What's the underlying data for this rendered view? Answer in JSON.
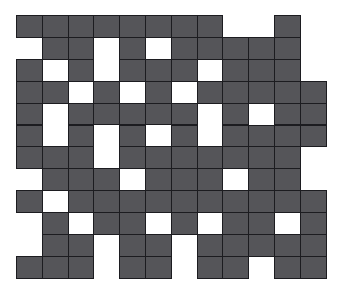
{
  "figure": {
    "name": "binary-grid-pattern",
    "type": "grid",
    "background_color": "#ffffff",
    "fill_color": "#555559",
    "stroke_color": "#1c1c20",
    "empty_color": "#ffffff"
  },
  "grid": {
    "rows": 12,
    "columns": 12,
    "origin_x": 16,
    "origin_y": 15,
    "cell_width": 25.8,
    "cell_height": 21.9,
    "legend": {
      "1": "filled cell",
      "0": "empty cell"
    },
    "matrix": [
      [
        1,
        1,
        1,
        1,
        1,
        1,
        1,
        1,
        0,
        0,
        1,
        0
      ],
      [
        0,
        1,
        1,
        0,
        1,
        0,
        1,
        1,
        1,
        1,
        1,
        0
      ],
      [
        1,
        0,
        1,
        0,
        1,
        1,
        1,
        0,
        1,
        1,
        1,
        0
      ],
      [
        1,
        1,
        0,
        1,
        0,
        1,
        0,
        1,
        1,
        1,
        1,
        1
      ],
      [
        1,
        0,
        1,
        1,
        1,
        1,
        1,
        0,
        1,
        0,
        1,
        1
      ],
      [
        1,
        0,
        1,
        0,
        1,
        0,
        1,
        0,
        1,
        1,
        1,
        1
      ],
      [
        1,
        1,
        1,
        0,
        1,
        1,
        1,
        1,
        1,
        1,
        1,
        0
      ],
      [
        0,
        1,
        1,
        1,
        0,
        1,
        1,
        1,
        0,
        1,
        1,
        0
      ],
      [
        1,
        0,
        1,
        1,
        1,
        1,
        1,
        1,
        1,
        1,
        1,
        1
      ],
      [
        0,
        1,
        0,
        1,
        1,
        0,
        1,
        0,
        1,
        1,
        0,
        1
      ],
      [
        0,
        1,
        1,
        0,
        1,
        1,
        0,
        1,
        1,
        1,
        1,
        1
      ],
      [
        1,
        1,
        1,
        0,
        1,
        1,
        0,
        1,
        1,
        0,
        1,
        1
      ]
    ],
    "filled_count": 114,
    "empty_count": 30
  }
}
